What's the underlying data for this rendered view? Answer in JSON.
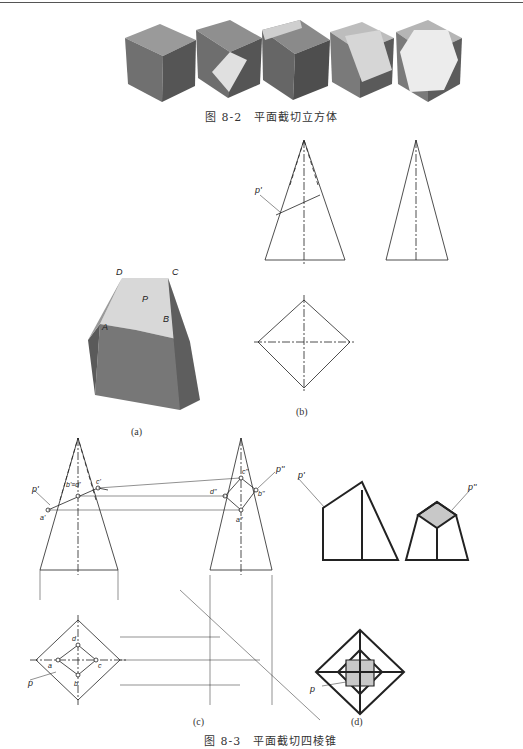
{
  "page": {
    "figure_8_2": {
      "caption": "图 8-2　平面截切立方体",
      "cubes": [
        "cube-1-intact",
        "cube-2-corner-cut",
        "cube-3-edge-cut",
        "cube-4-oblique-cut",
        "cube-5-hexagonal-cut"
      ]
    },
    "figure_8_3": {
      "caption": "图 8-3　平面截切四棱锥",
      "panels": {
        "a": {
          "label": "(a)",
          "vertex_labels": [
            "D",
            "C",
            "P",
            "A",
            "B"
          ]
        },
        "b": {
          "label": "(b)",
          "plane_label": "p'"
        },
        "c": {
          "label": "(c)",
          "labels": [
            "p'",
            "b'≡d'",
            "c'",
            "a'",
            "p''",
            "c''",
            "d''",
            "b''",
            "a''",
            "d",
            "a",
            "c",
            "b",
            "p"
          ]
        },
        "d": {
          "label": "(d)",
          "labels": [
            "p'",
            "p''",
            "p"
          ]
        }
      }
    },
    "colors": {
      "cube_top": "#9a9a9a",
      "cube_left": "#6e6e6e",
      "cube_right": "#555555",
      "cut_face": "#d8d8d8",
      "section_fill": "#c8c8c8",
      "line": "#222222"
    }
  }
}
